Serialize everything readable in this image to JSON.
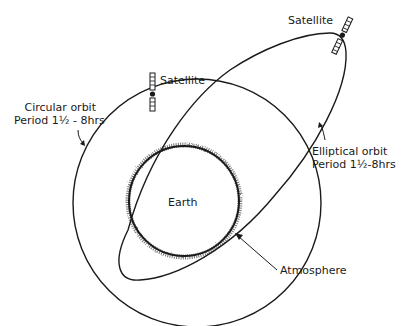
{
  "diagram": {
    "type": "orbit-comparison",
    "elements": {
      "earth": {
        "label": "Earth"
      },
      "atmosphere": {
        "label": "Atmosphere"
      },
      "circular_orbit": {
        "label_line1": "Circular orbit",
        "label_line2": "Period 1½ - 8hrs"
      },
      "elliptical_orbit": {
        "label_line1": "Elliptical orbit",
        "label_line2": "Period 1½-8hrs"
      },
      "satellite_circular": {
        "label": "Satellite"
      },
      "satellite_elliptical": {
        "label": "Satellite"
      }
    },
    "colors": {
      "ink": "#1a1a1a",
      "atmosphere": "#555555",
      "background": "#ffffff"
    }
  }
}
